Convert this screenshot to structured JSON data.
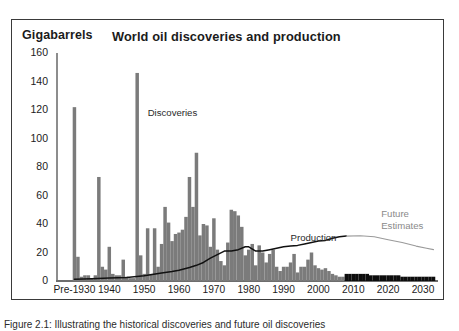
{
  "figure": {
    "caption": "Figure 2.1: Illustrating the historical discoveries and future oil discoveries",
    "frame_color": "#3a3a3a",
    "background": "#ffffff"
  },
  "chart_data": {
    "type": "bar",
    "title": "World oil discoveries and production",
    "ylabel": "Gigabarrels",
    "xlabel": "",
    "ylim": [
      0,
      160
    ],
    "xlim": [
      1925,
      2034
    ],
    "grid": false,
    "legend": "none",
    "ytick_labels": [
      "0",
      "20",
      "40",
      "60",
      "80",
      "100",
      "120",
      "140",
      "160"
    ],
    "ytick_values": [
      0,
      20,
      40,
      60,
      80,
      100,
      120,
      140,
      160
    ],
    "xtick_labels": [
      "Pre-1930",
      "1940",
      "1950",
      "1960",
      "1970",
      "1980",
      "1990",
      "2000",
      "2010",
      "2020",
      "2030"
    ],
    "xtick_values": [
      1930,
      1940,
      1950,
      1960,
      1970,
      1980,
      1990,
      2000,
      2010,
      2020,
      2030
    ],
    "annotations": [
      {
        "name": "discoveries",
        "text": "Discoveries",
        "x": 1951,
        "y": 118,
        "color": "#2a2a2a"
      },
      {
        "name": "production",
        "text": "Production",
        "x": 1992,
        "y": 30,
        "color": "#2a2a2a"
      },
      {
        "name": "future-estimates",
        "text": "Future\nEstimates",
        "x": 2018,
        "y": 47,
        "color": "#8a8a8a"
      }
    ],
    "series": [
      {
        "name": "Discoveries (historical)",
        "type": "bar",
        "color": "#7b7b7b",
        "x": [
          1930,
          1931,
          1932,
          1933,
          1934,
          1935,
          1936,
          1937,
          1938,
          1939,
          1940,
          1941,
          1942,
          1943,
          1944,
          1945,
          1946,
          1947,
          1948,
          1949,
          1950,
          1951,
          1952,
          1953,
          1954,
          1955,
          1956,
          1957,
          1958,
          1959,
          1960,
          1961,
          1962,
          1963,
          1964,
          1965,
          1966,
          1967,
          1968,
          1969,
          1970,
          1971,
          1972,
          1973,
          1974,
          1975,
          1976,
          1977,
          1978,
          1979,
          1980,
          1981,
          1982,
          1983,
          1984,
          1985,
          1986,
          1987,
          1988,
          1989,
          1990,
          1991,
          1992,
          1993,
          1994,
          1995,
          1996,
          1997,
          1998,
          1999,
          2000,
          2001,
          2002,
          2003,
          2004,
          2005,
          2006,
          2007
        ],
        "values": [
          122,
          17,
          3,
          4,
          4,
          2,
          4,
          73,
          10,
          8,
          24,
          5,
          4,
          4,
          15,
          3,
          2,
          2,
          146,
          18,
          5,
          37,
          5,
          37,
          10,
          26,
          52,
          41,
          28,
          33,
          34,
          36,
          45,
          73,
          52,
          90,
          32,
          40,
          39,
          24,
          44,
          22,
          14,
          11,
          27,
          50,
          49,
          46,
          38,
          18,
          22,
          26,
          11,
          25,
          20,
          13,
          19,
          22,
          10,
          7,
          10,
          10,
          13,
          19,
          6,
          10,
          10,
          15,
          20,
          11,
          9,
          8,
          9,
          7,
          5,
          4,
          3,
          3
        ]
      },
      {
        "name": "Discoveries (future estimate)",
        "type": "bar",
        "color": "#0d0d0d",
        "x": [
          2008,
          2009,
          2010,
          2011,
          2012,
          2013,
          2014,
          2015,
          2016,
          2017,
          2018,
          2019,
          2020,
          2021,
          2022,
          2023,
          2024,
          2025,
          2026,
          2027,
          2028,
          2029,
          2030,
          2031,
          2032,
          2033
        ],
        "values": [
          5,
          5,
          5,
          5,
          5,
          5,
          5,
          4,
          4,
          4,
          4,
          4,
          4,
          4,
          4,
          4,
          3,
          3,
          3,
          3,
          3,
          3,
          3,
          3,
          3,
          3
        ]
      },
      {
        "name": "Production (historical)",
        "type": "line",
        "color": "#111111",
        "x": [
          1930,
          1935,
          1940,
          1945,
          1950,
          1955,
          1958,
          1960,
          1963,
          1965,
          1967,
          1969,
          1971,
          1973,
          1975,
          1977,
          1979,
          1980,
          1982,
          1984,
          1986,
          1988,
          1990,
          1992,
          1994,
          1996,
          1998,
          2000,
          2002,
          2004,
          2006,
          2008
        ],
        "values": [
          1.3,
          1.6,
          2.1,
          2.4,
          3.7,
          5.6,
          6.6,
          7.6,
          9.5,
          11,
          13,
          16,
          18.5,
          21,
          21,
          22,
          24,
          24,
          21,
          21,
          22,
          23,
          24,
          24.5,
          25,
          26,
          27,
          28,
          28.5,
          30,
          31,
          31.5
        ]
      },
      {
        "name": "Production (future estimate)",
        "type": "line",
        "color": "#9a9a9a",
        "x": [
          2008,
          2012,
          2016,
          2020,
          2024,
          2028,
          2031,
          2033
        ],
        "values": [
          31.5,
          31.8,
          31,
          29,
          27,
          24.5,
          23,
          22
        ]
      }
    ]
  }
}
